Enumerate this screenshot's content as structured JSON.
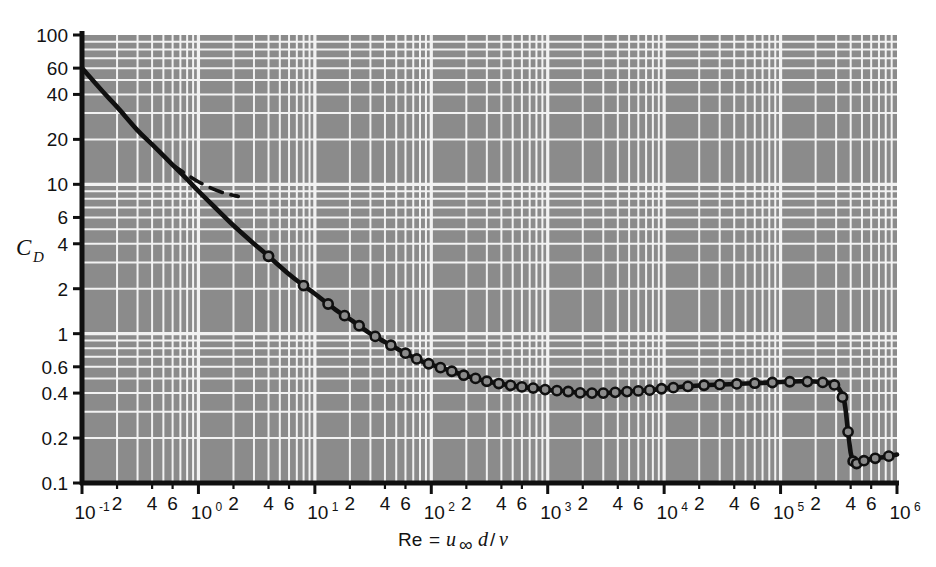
{
  "figure": {
    "background_color": "#ffffff",
    "plot_fill_color": "#8b8b8b",
    "grid_color": "#f2f2f2",
    "curve_color": "#101010",
    "axis_color": "#101010"
  },
  "chart_data": {
    "type": "line",
    "title": "",
    "subtitle": "",
    "xlabel_parts": {
      "re": "Re",
      "equals": "=",
      "u": "u",
      "infinity": "∞",
      "d": "d",
      "slash": "/",
      "nu": "ν"
    },
    "xlabel": "Re = u∞ d/ν",
    "ylabel": "C_D",
    "ylabel_parts": {
      "main": "C",
      "sub": "D"
    },
    "xscale": "log",
    "yscale": "log",
    "xlim": [
      0.1,
      1000000
    ],
    "ylim": [
      0.1,
      100
    ],
    "grid": true,
    "legend": "none",
    "x_decade_labels": [
      "10⁻¹",
      "10⁰",
      "10¹",
      "10²",
      "10³",
      "10⁴",
      "10⁵",
      "10⁶"
    ],
    "x_decade_bases": [
      "10",
      "10",
      "10",
      "10",
      "10",
      "10",
      "10",
      "10"
    ],
    "x_decade_exponents": [
      "-1",
      "0",
      "1",
      "2",
      "3",
      "4",
      "5",
      "6"
    ],
    "x_decade_values": [
      0.1,
      1,
      10,
      100,
      1000,
      10000,
      100000,
      1000000
    ],
    "x_minor_labels": [
      "2",
      "4",
      "6"
    ],
    "x_minor_multipliers": [
      2,
      4,
      6
    ],
    "y_tick_labels": [
      "100",
      "60",
      "40",
      "20",
      "10",
      "6",
      "4",
      "2",
      "1",
      "0.6",
      "0.4",
      "0.2",
      "0.1"
    ],
    "y_tick_values": [
      100,
      60,
      40,
      20,
      10,
      6,
      4,
      2,
      1,
      0.6,
      0.4,
      0.2,
      0.1
    ],
    "y_minor_values": [
      80,
      50,
      30,
      8,
      5,
      3,
      0.8,
      0.5,
      0.3
    ],
    "series": [
      {
        "name": "Sphere drag coefficient (experimental)",
        "style": "solid",
        "markers": "open-circle",
        "x": [
          0.1,
          0.15,
          0.2,
          0.3,
          0.4,
          0.6,
          0.8,
          1.0,
          1.5,
          2.0,
          3.0,
          4.0,
          6.0,
          8.0,
          10,
          15,
          20,
          30,
          40,
          60,
          80,
          100,
          150,
          200,
          300,
          400,
          600,
          800,
          1000,
          1500,
          2000,
          3000,
          5000,
          8000,
          10000,
          20000,
          40000,
          80000,
          150000,
          250000,
          300000,
          350000,
          380000,
          400000,
          420000,
          450000,
          500000,
          600000,
          800000,
          1000000
        ],
        "y": [
          60.0,
          42.0,
          33.0,
          23.0,
          18.5,
          13.5,
          10.8,
          9.0,
          6.6,
          5.3,
          4.0,
          3.3,
          2.5,
          2.1,
          1.85,
          1.45,
          1.25,
          1.0,
          0.88,
          0.74,
          0.66,
          0.62,
          0.56,
          0.52,
          0.48,
          0.46,
          0.44,
          0.43,
          0.42,
          0.41,
          0.4,
          0.4,
          0.41,
          0.42,
          0.43,
          0.45,
          0.46,
          0.47,
          0.48,
          0.47,
          0.45,
          0.36,
          0.22,
          0.16,
          0.14,
          0.135,
          0.14,
          0.145,
          0.15,
          0.155
        ]
      },
      {
        "name": "Stokes law (creeping flow, 24/Re)",
        "style": "dashed",
        "markers": "none",
        "x": [
          0.6,
          0.8,
          1.0,
          1.3,
          1.7,
          2.2
        ],
        "y": [
          13.5,
          11.6,
          10.4,
          9.4,
          8.7,
          8.3
        ]
      }
    ],
    "marker_points": {
      "comment": "Open circle markers are drawn along the experimental curve",
      "x": [
        4,
        8,
        13,
        18,
        24,
        33,
        45,
        60,
        75,
        95,
        120,
        150,
        190,
        240,
        300,
        380,
        480,
        600,
        750,
        950,
        1200,
        1500,
        1900,
        2400,
        3000,
        3800,
        4800,
        6000,
        7500,
        9500,
        12000,
        16000,
        22000,
        30000,
        42000,
        60000,
        85000,
        120000,
        170000,
        230000,
        290000,
        340000,
        380000,
        420000,
        450000,
        520000,
        650000,
        850000
      ]
    },
    "annotations": [
      {
        "text": "",
        "note": "No printed text annotations appear inside the plot area"
      }
    ]
  }
}
